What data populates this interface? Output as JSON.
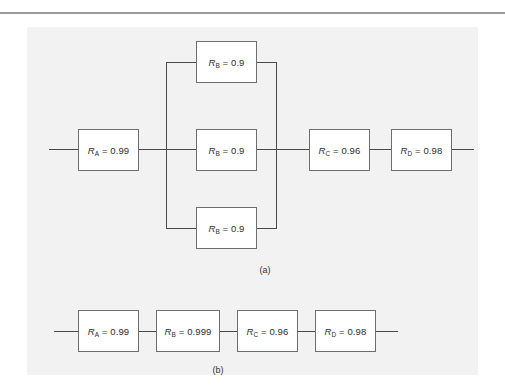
{
  "figure": {
    "panel_background": "#f2f2f2",
    "page_background": "#ffffff",
    "line_color": "#4a4a4a",
    "box_border_color": "#6e6e6e",
    "box_fill": "#ffffff",
    "rule_color": "#9a9a9a"
  },
  "diagram_a": {
    "caption": "(a)",
    "series_input": {
      "label_symbol": "R",
      "label_subscript": "A",
      "label_value": "0.99",
      "label_text": "R_A = 0.99"
    },
    "parallel_group": {
      "count": 3,
      "branches": [
        {
          "position": "top",
          "label_symbol": "R",
          "label_subscript": "B",
          "label_value": "0.9",
          "label_text": "R_B = 0.9"
        },
        {
          "position": "middle",
          "label_symbol": "R",
          "label_subscript": "B",
          "label_value": "0.9",
          "label_text": "R_B = 0.9"
        },
        {
          "position": "bottom",
          "label_symbol": "R",
          "label_subscript": "B",
          "label_value": "0.9",
          "label_text": "R_B = 0.9"
        }
      ]
    },
    "series_tail": [
      {
        "label_symbol": "R",
        "label_subscript": "C",
        "label_value": "0.96",
        "label_text": "R_C = 0.96"
      },
      {
        "label_symbol": "R",
        "label_subscript": "D",
        "label_value": "0.98",
        "label_text": "R_D = 0.98"
      }
    ]
  },
  "diagram_b": {
    "caption": "(b)",
    "blocks": [
      {
        "label_symbol": "R",
        "label_subscript": "A",
        "label_value": "0.99",
        "label_text": "R_A = 0.99"
      },
      {
        "label_symbol": "R",
        "label_subscript": "B",
        "label_value": "0.999",
        "label_text": "R_B = 0.999"
      },
      {
        "label_symbol": "R",
        "label_subscript": "C",
        "label_value": "0.96",
        "label_text": "R_C = 0.96"
      },
      {
        "label_symbol": "R",
        "label_subscript": "D",
        "label_value": "0.98",
        "label_text": "R_D = 0.98"
      }
    ]
  }
}
